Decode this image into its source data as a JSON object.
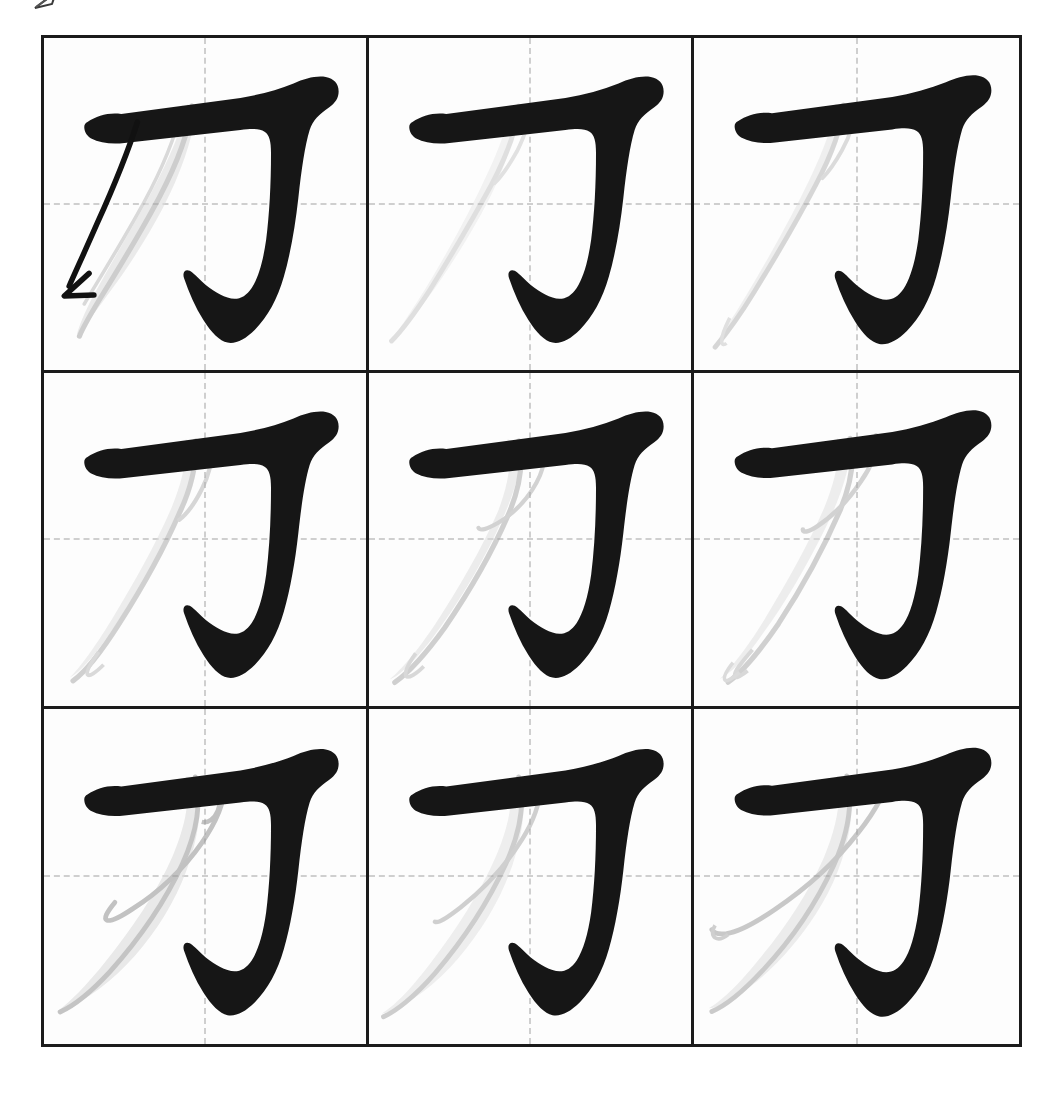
{
  "document": {
    "type": "character-stroke-order-practice-sheet",
    "character": "刀",
    "title": "",
    "background_color": "#ffffff"
  },
  "grid": {
    "rows": 3,
    "columns": 3,
    "cell_count": 9,
    "border_color": "#1b1b1b",
    "border_width_px": 3,
    "guide_style": "dashed",
    "guide_color": "#cfcfcf",
    "guide_type": "tian-zi-ge-center-cross",
    "outer_left_px": 41,
    "outer_top_px": 35,
    "outer_width_px": 981,
    "outer_height_px": 1012
  },
  "colors": {
    "ink_black": "#161616",
    "ghost_gray_fill": "#d9d9d9",
    "ghost_gray_light": "#e9e9e9",
    "ghost_gray_outline": "#9a9a9a",
    "arrow_black": "#111111",
    "grid_line": "#1b1b1b",
    "guide_line": "#cfcfcf",
    "paper": "#ffffff"
  },
  "strokes": {
    "completed_stroke_name": "heng-zhe-gou",
    "practice_stroke_name": "pie",
    "practice_stroke_index": 2,
    "total_strokes": 2
  },
  "top_mark": {
    "name": "cropped-arrowhead-mark",
    "visible": true,
    "description": "small partial arrow glyph cut off by the top page edge"
  },
  "cells": [
    {
      "id": "cell-1",
      "row": 1,
      "column": 1,
      "label": "1",
      "has_direction_arrow": true,
      "ghost_variant": "wide-soft",
      "ghost_opacity": 0.55
    },
    {
      "id": "cell-2",
      "row": 1,
      "column": 2,
      "label": "2",
      "has_direction_arrow": false,
      "ghost_variant": "narrow-pale",
      "ghost_opacity": 0.4
    },
    {
      "id": "cell-3",
      "row": 1,
      "column": 3,
      "label": "3",
      "has_direction_arrow": false,
      "ghost_variant": "narrow-pale",
      "ghost_opacity": 0.45
    },
    {
      "id": "cell-4",
      "row": 2,
      "column": 1,
      "label": "4",
      "has_direction_arrow": false,
      "ghost_variant": "medium-hooked",
      "ghost_opacity": 0.5
    },
    {
      "id": "cell-5",
      "row": 2,
      "column": 2,
      "label": "5",
      "has_direction_arrow": false,
      "ghost_variant": "medium-tapered",
      "ghost_opacity": 0.5
    },
    {
      "id": "cell-6",
      "row": 2,
      "column": 3,
      "label": "6",
      "has_direction_arrow": false,
      "ghost_variant": "medium-double",
      "ghost_opacity": 0.5
    },
    {
      "id": "cell-7",
      "row": 3,
      "column": 1,
      "label": "7",
      "has_direction_arrow": false,
      "ghost_variant": "broad-blade",
      "ghost_opacity": 0.6
    },
    {
      "id": "cell-8",
      "row": 3,
      "column": 2,
      "label": "8",
      "has_direction_arrow": false,
      "ghost_variant": "broad-blade",
      "ghost_opacity": 0.55
    },
    {
      "id": "cell-9",
      "row": 3,
      "column": 3,
      "label": "9",
      "has_direction_arrow": false,
      "ghost_variant": "broad-outlined",
      "ghost_opacity": 0.55
    }
  ]
}
